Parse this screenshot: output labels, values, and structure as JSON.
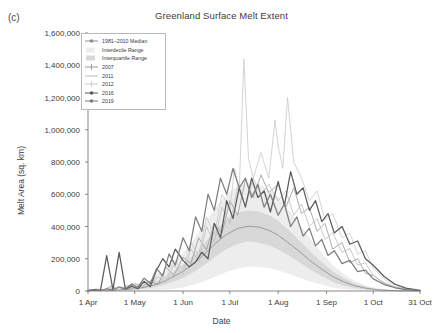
{
  "panel": {
    "label": "(c)"
  },
  "chart_data": {
    "type": "line",
    "title": "Greenland Surface Melt Extent",
    "xlabel": "Date",
    "ylabel": "Melt Area (sq. km)",
    "grid": false,
    "legend_position": "top-left",
    "ylim": [
      0,
      1600000
    ],
    "yticks": [
      0,
      200000,
      400000,
      600000,
      800000,
      1000000,
      1200000,
      1400000,
      1600000
    ],
    "ytick_labels": [
      "0",
      "200,000",
      "400,000",
      "600,000",
      "800,000",
      "1,000,000",
      "1,200,000",
      "1,400,000",
      "1,600,000"
    ],
    "xlim": [
      0,
      213
    ],
    "xticks": [
      0,
      30,
      61,
      91,
      122,
      153,
      183,
      213
    ],
    "xtick_labels": [
      "1 Apr",
      "1 May",
      "1 Jun",
      "1 Jul",
      "1 Aug",
      "1 Sep",
      "1 Oct",
      "31 Oct"
    ],
    "legend": [
      {
        "label": "1981–2010 Median",
        "marker": "line-dot",
        "color": "#8d8d8d"
      },
      {
        "label": "Interdecile Range",
        "marker": "swatch",
        "color": "#ededed"
      },
      {
        "label": "Interquartile Range",
        "marker": "swatch",
        "color": "#d8d8d8"
      },
      {
        "label": "2007",
        "marker": "line-plus",
        "color": "#9a9a9a"
      },
      {
        "label": "2011",
        "marker": "line",
        "color": "#bdbdbd"
      },
      {
        "label": "2012",
        "marker": "line-plus",
        "color": "#c9c9c9"
      },
      {
        "label": "2016",
        "marker": "line-dot",
        "color": "#5a5a5a"
      },
      {
        "label": "2019",
        "marker": "line-dot",
        "color": "#7d7d7d"
      }
    ],
    "bands": [
      {
        "name": "Interdecile Range",
        "color": "#ededed",
        "x": [
          0,
          7,
          14,
          21,
          28,
          35,
          42,
          49,
          56,
          61,
          68,
          75,
          82,
          89,
          96,
          103,
          110,
          117,
          122,
          129,
          136,
          143,
          150,
          157,
          164,
          171,
          178,
          185,
          192,
          199,
          206,
          213
        ],
        "lower": [
          0,
          0,
          0,
          0,
          0,
          2000,
          4000,
          8000,
          15000,
          22000,
          40000,
          62000,
          90000,
          118000,
          140000,
          152000,
          150000,
          140000,
          128000,
          105000,
          82000,
          58000,
          38000,
          22000,
          12000,
          6000,
          3000,
          1000,
          500,
          0,
          0,
          0
        ],
        "upper": [
          8000,
          10000,
          14000,
          20000,
          30000,
          48000,
          78000,
          125000,
          190000,
          235000,
          320000,
          420000,
          520000,
          600000,
          650000,
          672000,
          660000,
          620000,
          580000,
          500000,
          410000,
          320000,
          235000,
          160000,
          105000,
          62000,
          35000,
          18000,
          9000,
          4000,
          2000,
          1000
        ]
      },
      {
        "name": "Interquartile Range",
        "color": "#d8d8d8",
        "x": [
          0,
          7,
          14,
          21,
          28,
          35,
          42,
          49,
          56,
          61,
          68,
          75,
          82,
          89,
          96,
          103,
          110,
          117,
          122,
          129,
          136,
          143,
          150,
          157,
          164,
          171,
          178,
          185,
          192,
          199,
          206,
          213
        ],
        "lower": [
          1000,
          1500,
          2500,
          4000,
          7000,
          12000,
          22000,
          38000,
          62000,
          82000,
          118000,
          165000,
          215000,
          260000,
          292000,
          308000,
          300000,
          280000,
          258000,
          218000,
          175000,
          130000,
          92000,
          58000,
          34000,
          18000,
          9000,
          4000,
          2000,
          800,
          300,
          0
        ],
        "upper": [
          5000,
          6500,
          9000,
          13000,
          20000,
          32000,
          52000,
          85000,
          130000,
          165000,
          225000,
          300000,
          380000,
          445000,
          485000,
          500000,
          492000,
          465000,
          435000,
          375000,
          310000,
          240000,
          178000,
          122000,
          80000,
          48000,
          27000,
          13000,
          6500,
          3000,
          1200,
          500
        ]
      }
    ],
    "series": [
      {
        "name": "1981–2010 Median",
        "color": "#9b9b9b",
        "width": 1.0,
        "x": [
          0,
          7,
          14,
          21,
          28,
          35,
          42,
          49,
          56,
          61,
          68,
          75,
          82,
          89,
          96,
          103,
          110,
          117,
          122,
          129,
          136,
          143,
          150,
          157,
          164,
          171,
          178,
          185,
          192,
          199,
          206,
          213
        ],
        "values": [
          2500,
          3500,
          5000,
          8000,
          13000,
          21000,
          36000,
          60000,
          95000,
          122000,
          170000,
          232000,
          298000,
          352000,
          388000,
          402000,
          396000,
          372000,
          346000,
          296000,
          242000,
          185000,
          135000,
          90000,
          57000,
          33000,
          18000,
          8500,
          4000,
          1800,
          700,
          200
        ]
      },
      {
        "name": "2007",
        "color": "#9d9d9d",
        "width": 0.85,
        "x": [
          0,
          5,
          10,
          15,
          20,
          25,
          30,
          35,
          40,
          45,
          50,
          55,
          61,
          66,
          71,
          76,
          81,
          86,
          91,
          96,
          101,
          106,
          111,
          116,
          122,
          127,
          132,
          137,
          142,
          147,
          152,
          157,
          163,
          168,
          173,
          178,
          183,
          190,
          197,
          204,
          213
        ],
        "values": [
          3000,
          12000,
          6000,
          30000,
          9000,
          18000,
          46000,
          28000,
          62000,
          40000,
          150000,
          95000,
          210000,
          170000,
          330000,
          255000,
          420000,
          360000,
          560000,
          470000,
          690000,
          580000,
          720000,
          610000,
          660000,
          520000,
          640000,
          480000,
          520000,
          370000,
          420000,
          260000,
          300000,
          175000,
          200000,
          110000,
          95000,
          48000,
          22000,
          10000,
          3000
        ]
      },
      {
        "name": "2011",
        "color": "#c0c0c0",
        "width": 0.85,
        "x": [
          0,
          5,
          10,
          15,
          20,
          25,
          30,
          35,
          40,
          45,
          50,
          55,
          61,
          66,
          71,
          76,
          81,
          86,
          91,
          96,
          101,
          106,
          111,
          116,
          122,
          127,
          132,
          137,
          142,
          147,
          152,
          157,
          163,
          168,
          173,
          178,
          183,
          190,
          197,
          204,
          213
        ],
        "values": [
          2000,
          8000,
          4000,
          16000,
          7000,
          30000,
          14000,
          50000,
          26000,
          90000,
          52000,
          160000,
          105000,
          260000,
          185000,
          400000,
          300000,
          520000,
          420000,
          640000,
          530000,
          700000,
          600000,
          660000,
          560000,
          620000,
          470000,
          540000,
          400000,
          450000,
          320000,
          360000,
          240000,
          265000,
          160000,
          175000,
          95000,
          52000,
          26000,
          11000,
          2500
        ]
      },
      {
        "name": "2012",
        "color": "#cccccc",
        "width": 0.85,
        "x": [
          0,
          5,
          10,
          15,
          20,
          25,
          30,
          35,
          40,
          45,
          50,
          55,
          61,
          66,
          71,
          76,
          81,
          86,
          91,
          94,
          97,
          100,
          103,
          106,
          111,
          116,
          120,
          122,
          125,
          128,
          132,
          137,
          142,
          147,
          152,
          157,
          163,
          168,
          173,
          178,
          183,
          190,
          197,
          204,
          213
        ],
        "values": [
          2500,
          10000,
          5000,
          22000,
          10000,
          38000,
          18000,
          60000,
          32000,
          110000,
          70000,
          190000,
          130000,
          300000,
          220000,
          460000,
          350000,
          600000,
          500000,
          760000,
          620000,
          1440000,
          820000,
          700000,
          860000,
          700000,
          1060000,
          900000,
          760000,
          1200000,
          800000,
          700000,
          560000,
          620000,
          440000,
          480000,
          330000,
          360000,
          230000,
          250000,
          140000,
          75000,
          36000,
          15000,
          3500
        ]
      },
      {
        "name": "2016",
        "color": "#5c5c5c",
        "width": 1.25,
        "x": [
          0,
          4,
          8,
          12,
          16,
          20,
          24,
          28,
          32,
          36,
          40,
          44,
          48,
          52,
          56,
          61,
          65,
          69,
          73,
          77,
          81,
          85,
          89,
          93,
          97,
          101,
          105,
          109,
          113,
          117,
          122,
          126,
          130,
          134,
          138,
          142,
          146,
          150,
          154,
          158,
          163,
          168,
          173,
          178,
          183,
          190,
          197,
          204,
          213
        ],
        "values": [
          3000,
          9000,
          4000,
          220000,
          8000,
          240000,
          10000,
          30000,
          14000,
          60000,
          28000,
          130000,
          200000,
          150000,
          260000,
          190000,
          150000,
          180000,
          240000,
          200000,
          420000,
          330000,
          560000,
          450000,
          640000,
          520000,
          700000,
          580000,
          620000,
          490000,
          680000,
          530000,
          740000,
          600000,
          640000,
          500000,
          560000,
          430000,
          480000,
          360000,
          400000,
          290000,
          310000,
          200000,
          160000,
          90000,
          42000,
          18000,
          4000
        ]
      },
      {
        "name": "2019",
        "color": "#7e7e7e",
        "width": 1.25,
        "x": [
          0,
          4,
          8,
          12,
          16,
          20,
          24,
          28,
          32,
          36,
          40,
          44,
          48,
          52,
          56,
          61,
          65,
          69,
          73,
          77,
          81,
          85,
          89,
          93,
          97,
          101,
          105,
          109,
          113,
          117,
          122,
          126,
          130,
          134,
          138,
          142,
          146,
          150,
          154,
          158,
          163,
          168,
          173,
          178,
          183,
          190,
          197,
          204,
          213
        ],
        "values": [
          2000,
          6000,
          3000,
          14000,
          6000,
          26000,
          12000,
          44000,
          22000,
          80000,
          46000,
          140000,
          92000,
          230000,
          160000,
          330000,
          250000,
          460000,
          370000,
          600000,
          500000,
          700000,
          600000,
          760000,
          640000,
          700000,
          580000,
          660000,
          520000,
          600000,
          470000,
          540000,
          400000,
          460000,
          340000,
          390000,
          280000,
          320000,
          220000,
          250000,
          170000,
          190000,
          120000,
          130000,
          75000,
          40000,
          20000,
          8000,
          2000
        ]
      }
    ]
  }
}
